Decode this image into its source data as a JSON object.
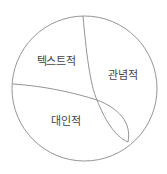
{
  "diagram": {
    "type": "region-partition-circle",
    "stroke_color": "#888888",
    "text_color": "#444444",
    "regions": [
      {
        "id": "textual",
        "label": "텍스트적",
        "x": 56,
        "y": 60
      },
      {
        "id": "ideational",
        "label": "관념적",
        "x": 123,
        "y": 74
      },
      {
        "id": "interpersonal",
        "label": "대인적",
        "x": 66,
        "y": 120
      }
    ]
  }
}
